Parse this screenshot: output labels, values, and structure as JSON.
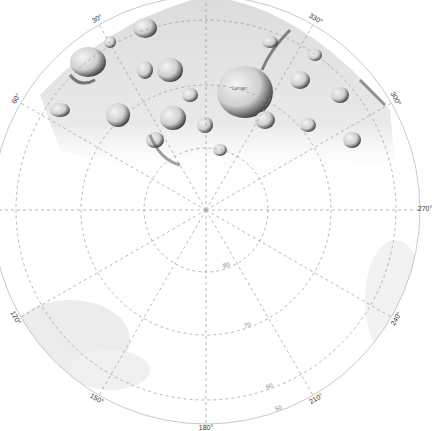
{
  "map": {
    "projection": "polar stereographic",
    "center_label": "",
    "center_px": [
      206,
      210
    ],
    "colors": {
      "background": "#ffffff",
      "grid": "#9a9a9a",
      "terrain_light": "#e8e8e8",
      "terrain_mid": "#b8b8b8",
      "terrain_dark": "#2a2a2a",
      "shade": "#d6d6d6"
    },
    "longitude_labels": [
      {
        "text": "0°",
        "angle": 0
      },
      {
        "text": "30°",
        "angle": 30
      },
      {
        "text": "60°",
        "angle": 60
      },
      {
        "text": "120°",
        "angle": 120
      },
      {
        "text": "150°",
        "angle": 150
      },
      {
        "text": "180°",
        "angle": 180
      },
      {
        "text": "210°",
        "angle": 210
      },
      {
        "text": "240°",
        "angle": 240
      },
      {
        "text": "270°",
        "angle": 270
      },
      {
        "text": "300°",
        "angle": 300
      },
      {
        "text": "330°",
        "angle": 330
      }
    ],
    "latitude_rings": [
      {
        "label": "80",
        "radius": 62
      },
      {
        "label": "70",
        "radius": 125
      },
      {
        "label": "60",
        "radius": 190
      },
      {
        "label": "50",
        "radius": 214
      }
    ],
    "crater_labels": [
      {
        "text": "Lyman"
      }
    ]
  }
}
